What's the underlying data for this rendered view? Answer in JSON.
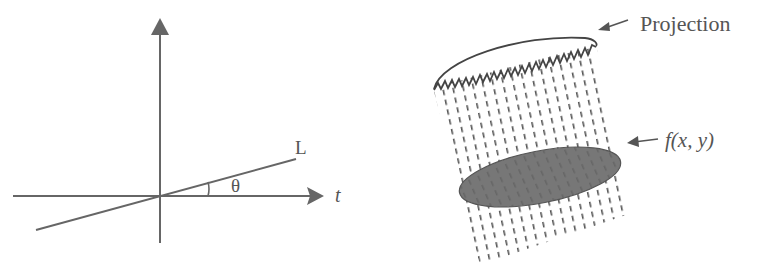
{
  "left_panel": {
    "line_label": "L",
    "angle_label": "θ",
    "axis_label": "t"
  },
  "right_panel": {
    "projection_label": "Projection",
    "object_label": "f(x, y)"
  },
  "colors": {
    "stroke": "#555555",
    "ellipse_fill": "#777777"
  }
}
